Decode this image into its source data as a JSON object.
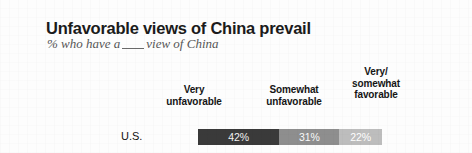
{
  "chart_data": {
    "type": "bar",
    "orientation": "horizontal",
    "stacked": true,
    "title": "Unfavorable views of China prevail",
    "subtitle_prefix": "% who have a",
    "subtitle_suffix": "view of China",
    "subtitle": "% who have a ___ view of China",
    "xlabel": "",
    "ylabel": "",
    "grid": false,
    "legend_position": "top-as-column-headers",
    "categories": [
      "U.S."
    ],
    "series": [
      {
        "name": "Very unfavorable",
        "values": [
          42
        ],
        "label": "42%",
        "color": "#3a3a3a"
      },
      {
        "name": "Somewhat unfavorable",
        "values": [
          31
        ],
        "label": "31%",
        "color": "#8e8e8e"
      },
      {
        "name": "Very/somewhat favorable",
        "values": [
          22
        ],
        "label": "22%",
        "color": "#bdbdbd"
      }
    ],
    "xlim": [
      0,
      95
    ],
    "units": "percent"
  },
  "header": {
    "columns": [
      {
        "line1": "Very",
        "line2": "unfavorable"
      },
      {
        "line1": "Somewhat",
        "line2": "unfavorable"
      },
      {
        "line1": "Very/",
        "line2": "somewhat",
        "line3": "favorable"
      }
    ]
  },
  "row": {
    "label": "U.S.",
    "very_unfavorable": "42%",
    "somewhat_unfavorable": "31%",
    "favorable": "22%"
  },
  "colors": {
    "background": "#fdfdfd",
    "title": "#1b1b1b",
    "subtitle": "#575757",
    "very_unfavorable": "#3a3a3a",
    "somewhat_unfavorable": "#8e8e8e",
    "favorable": "#bdbdbd"
  }
}
